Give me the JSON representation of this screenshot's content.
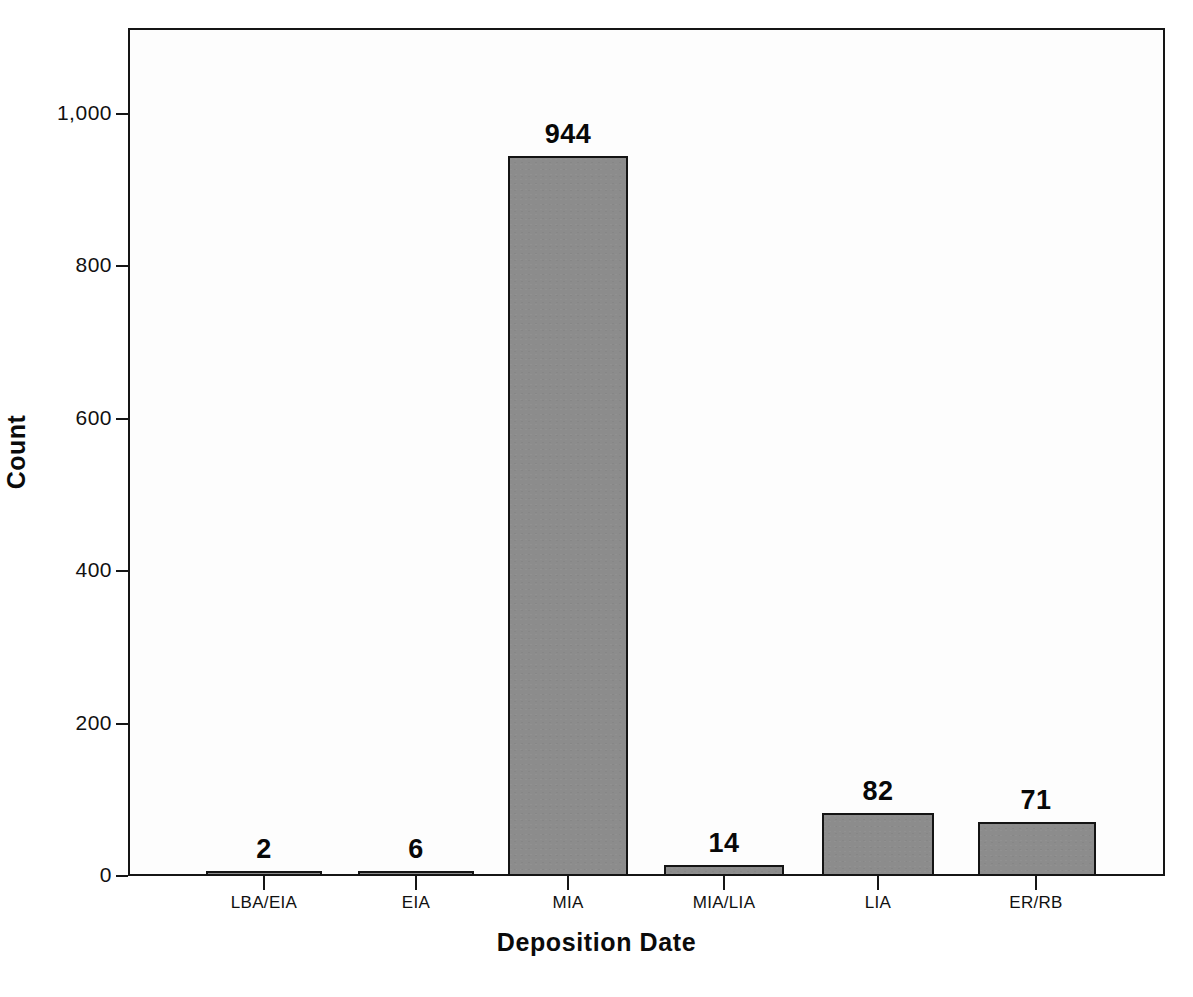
{
  "chart_data": {
    "type": "bar",
    "title": "",
    "subtitle": "",
    "xlabel": "Deposition Date",
    "ylabel": "Count",
    "categories": [
      "LBA/EIA",
      "EIA",
      "MIA",
      "MIA/LIA",
      "LIA",
      "ER/RB"
    ],
    "values": [
      2,
      6,
      944,
      14,
      82,
      71
    ],
    "value_labels": [
      "2",
      "6",
      "944",
      "14",
      "82",
      "71"
    ],
    "ylim": [
      0,
      1120
    ],
    "ytick_values": [
      0,
      200,
      400,
      600,
      800,
      1000
    ],
    "ytick_labels": [
      "0",
      "200",
      "400",
      "600",
      "800",
      "1,000"
    ],
    "grid": false,
    "legend": null,
    "legend_position": "none",
    "bar_fill_color": "#8c8c8c",
    "bar_edge_color": "#141414",
    "axis_color": "#151515",
    "background_color": "#ffffff",
    "plot_background_color": "#fdfdfd",
    "data_labels_shown": true
  },
  "axes": {
    "y_title": "Count",
    "x_title": "Deposition Date"
  }
}
